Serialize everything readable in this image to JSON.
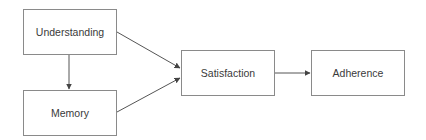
{
  "diagram": {
    "type": "flowchart",
    "nodes": [
      {
        "id": "understanding",
        "label": "Understanding"
      },
      {
        "id": "memory",
        "label": "Memory"
      },
      {
        "id": "satisfaction",
        "label": "Satisfaction"
      },
      {
        "id": "adherence",
        "label": "Adherence"
      }
    ],
    "edges": [
      {
        "from": "understanding",
        "to": "memory"
      },
      {
        "from": "understanding",
        "to": "satisfaction"
      },
      {
        "from": "memory",
        "to": "satisfaction"
      },
      {
        "from": "satisfaction",
        "to": "adherence"
      }
    ],
    "colors": {
      "border": "#8a8a8a",
      "text": "#3a3a3a",
      "arrow": "#555555",
      "background": "#ffffff"
    }
  }
}
